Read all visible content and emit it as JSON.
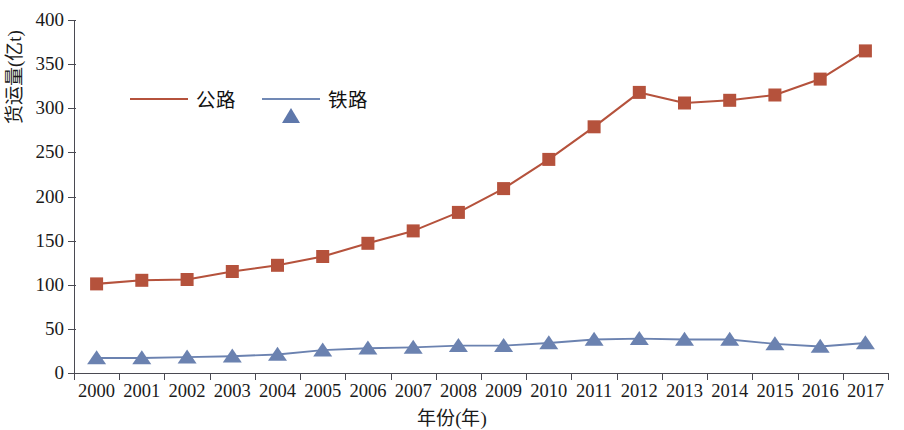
{
  "chart_data": {
    "type": "line",
    "title": "",
    "subtitle": "",
    "xlabel": "年份(年)",
    "ylabel": "货运量(亿t)",
    "x": [
      2000,
      2001,
      2002,
      2003,
      2004,
      2005,
      2006,
      2007,
      2008,
      2009,
      2010,
      2011,
      2012,
      2013,
      2014,
      2015,
      2016,
      2017
    ],
    "categories": [
      "2000",
      "2001",
      "2002",
      "2003",
      "2004",
      "2005",
      "2006",
      "2007",
      "2008",
      "2009",
      "2010",
      "2011",
      "2012",
      "2013",
      "2014",
      "2015",
      "2016",
      "2017"
    ],
    "series": [
      {
        "name": "公路",
        "color": "#b5523c",
        "marker": "square",
        "values": [
          101,
          105,
          106,
          115,
          122,
          132,
          147,
          161,
          182,
          209,
          242,
          279,
          318,
          306,
          309,
          315,
          333,
          365
        ]
      },
      {
        "name": "铁路",
        "color": "#6b82b0",
        "marker": "triangle",
        "values": [
          17,
          17,
          18,
          19,
          21,
          26,
          28,
          29,
          31,
          31,
          34,
          38,
          39,
          38,
          38,
          33,
          30,
          34
        ]
      }
    ],
    "ylim": [
      0,
      400
    ],
    "ytick_values": [
      0,
      50,
      100,
      150,
      200,
      250,
      300,
      350,
      400
    ],
    "ytick_labels": [
      "0",
      "50",
      "100",
      "150",
      "200",
      "250",
      "300",
      "350",
      "400"
    ],
    "grid": false,
    "legend_position": "top-left",
    "legend_entries": [
      "公路",
      "铁路"
    ]
  },
  "axis": {
    "y_title": "货运量(亿t)",
    "x_title": "年份(年)"
  },
  "legend": {
    "items": [
      {
        "label": "公路",
        "icon": "red-square-marker"
      },
      {
        "label": "铁路",
        "icon": "blue-triangle-marker"
      }
    ]
  },
  "colors": {
    "highway": "#b5523c",
    "railway": "#6b82b0",
    "axis": "#4a4a52",
    "text": "#1a1a1a",
    "background": "#ffffff"
  }
}
